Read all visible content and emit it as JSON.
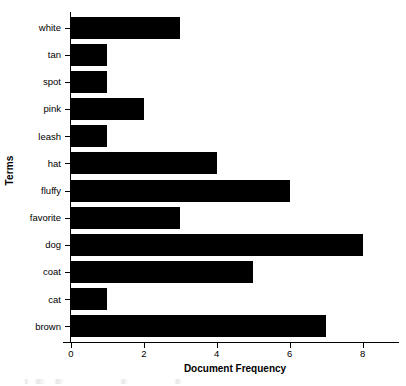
{
  "chart_data": {
    "type": "bar",
    "orientation": "horizontal",
    "title": "",
    "xlabel": "Document Frequency",
    "ylabel": "Terms",
    "categories": [
      "white",
      "tan",
      "spot",
      "pink",
      "leash",
      "hat",
      "fluffy",
      "favorite",
      "dog",
      "coat",
      "cat",
      "brown"
    ],
    "values": [
      3,
      1,
      1,
      2,
      1,
      4,
      6,
      3,
      8,
      5,
      1,
      7
    ],
    "xlim": [
      0,
      9
    ],
    "xticks": [
      0,
      2,
      4,
      6,
      8
    ],
    "xtick_labels": [
      "0",
      "2",
      "4",
      "6",
      "8"
    ],
    "grid": false,
    "legend": false,
    "bar_color": "#000000",
    "background_color": "#ffffff",
    "axis_color": "#000000"
  }
}
